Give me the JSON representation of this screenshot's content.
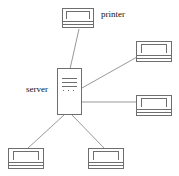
{
  "diagram": {
    "canvas": {
      "width": 179,
      "height": 176,
      "background": "#ffffff"
    },
    "style": {
      "stroke": "#6e6e6e",
      "edge_stroke": "#8c8c8c",
      "text": "#111111"
    },
    "labels": [
      {
        "id": "printer-label",
        "text": "printer",
        "x": 101,
        "y": 9
      },
      {
        "id": "server-label",
        "text": "server",
        "x": 26,
        "y": 84
      }
    ],
    "nodes": [
      {
        "id": "printer",
        "kind": "printer",
        "label": "printer",
        "x": 62,
        "y": 8,
        "w": 32,
        "h": 20
      },
      {
        "id": "workstation-top-right",
        "kind": "computer",
        "label": "",
        "x": 136,
        "y": 41,
        "w": 36,
        "h": 21
      },
      {
        "id": "server",
        "kind": "server-tower",
        "label": "server",
        "x": 57,
        "y": 68,
        "w": 25,
        "h": 47
      },
      {
        "id": "workstation-right",
        "kind": "computer",
        "label": "",
        "x": 136,
        "y": 95,
        "w": 36,
        "h": 21
      },
      {
        "id": "workstation-bottom-left",
        "kind": "computer",
        "label": "",
        "x": 8,
        "y": 148,
        "w": 36,
        "h": 21
      },
      {
        "id": "workstation-bottom-right",
        "kind": "computer",
        "label": "",
        "x": 88,
        "y": 148,
        "w": 36,
        "h": 21
      }
    ],
    "edges": [
      {
        "id": "edge-server-printer",
        "from": "server",
        "to": "printer",
        "x1": 70,
        "y1": 69,
        "x2": 79,
        "y2": 29
      },
      {
        "id": "edge-server-workstation-top-right",
        "from": "server",
        "to": "workstation-top-right",
        "x1": 82,
        "y1": 88,
        "x2": 136,
        "y2": 57
      },
      {
        "id": "edge-server-workstation-right",
        "from": "server",
        "to": "workstation-right",
        "x1": 82,
        "y1": 102,
        "x2": 136,
        "y2": 102
      },
      {
        "id": "edge-server-workstation-bottom-left",
        "from": "server",
        "to": "workstation-bottom-left",
        "x1": 64,
        "y1": 115,
        "x2": 27,
        "y2": 148
      },
      {
        "id": "edge-server-workstation-bottom-right",
        "from": "server",
        "to": "workstation-bottom-right",
        "x1": 72,
        "y1": 115,
        "x2": 105,
        "y2": 148
      }
    ]
  }
}
